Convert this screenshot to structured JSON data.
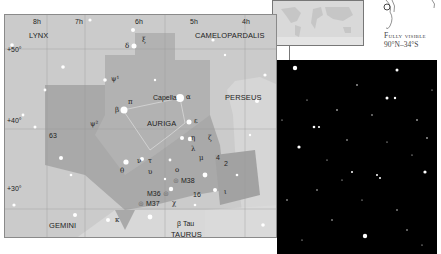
{
  "chart": {
    "ra_labels": [
      "8h",
      "7h",
      "6h",
      "5h",
      "4h"
    ],
    "dec_labels": [
      "+50°",
      "+40°",
      "+30°"
    ],
    "constellations": {
      "lynx": "LYNX",
      "camelopardalis": "CAMELOPARDALIS",
      "perseus": "PERSEUS",
      "auriga": "AURIGA",
      "gemini": "GEMINI",
      "taurus": "TAURUS"
    },
    "stars": {
      "capella": "Capella",
      "alpha": "α",
      "beta": "β",
      "pi": "π",
      "delta": "δ",
      "xi": "ξ",
      "psi1": "ψ¹",
      "psi2": "ψ²",
      "n63": "63",
      "epsilon": "ε",
      "eta": "η",
      "zeta": "ζ",
      "lambda": "λ",
      "mu": "μ",
      "n4": "4",
      "n2": "2",
      "nu": "ν",
      "tau": "τ",
      "theta": "θ",
      "upsilon": "υ",
      "omicron": "ο",
      "n16": "16",
      "iota": "ι",
      "chi": "χ",
      "kappa": "κ",
      "beta_tau": "β Tau"
    },
    "clusters": [
      "M38",
      "M36",
      "M37"
    ]
  },
  "visibility": {
    "line1": "Fully visible",
    "line2": "90°N–34°S"
  }
}
